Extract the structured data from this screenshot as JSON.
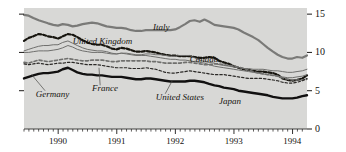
{
  "chart_data": {
    "type": "line",
    "title": "",
    "subtitle": "",
    "xlabel": "",
    "ylabel": "",
    "ylim": [
      0,
      15.8
    ],
    "yticks": [
      0,
      5,
      10,
      15
    ],
    "ytick_labels": [
      "0",
      "5",
      "10",
      "15"
    ],
    "y_axis_position": "right",
    "xlim": [
      1989.42,
      1994.25
    ],
    "xticks": [
      1990,
      1991,
      1992,
      1993,
      1994
    ],
    "xtick_labels": [
      "1990",
      "1991",
      "1992",
      "1993",
      "1994"
    ],
    "minor_xticks": "monthly",
    "grid": false,
    "legend": "inline-annotations",
    "plot_background": "#d8d8d6",
    "series": [
      {
        "name": "Italy",
        "color": "#7a7a78",
        "width": 2.2,
        "dash": "none",
        "label_x": 1991.62,
        "label_y": 13.15,
        "x": [
          1989.42,
          1989.5,
          1989.58,
          1989.67,
          1989.75,
          1989.83,
          1989.92,
          1990.0,
          1990.08,
          1990.17,
          1990.25,
          1990.33,
          1990.42,
          1990.5,
          1990.58,
          1990.67,
          1990.75,
          1990.83,
          1990.92,
          1991.0,
          1991.08,
          1991.17,
          1991.25,
          1991.33,
          1991.42,
          1991.5,
          1991.58,
          1991.67,
          1991.75,
          1991.83,
          1991.92,
          1992.0,
          1992.08,
          1992.17,
          1992.25,
          1992.33,
          1992.42,
          1992.5,
          1992.58,
          1992.67,
          1992.75,
          1992.83,
          1992.92,
          1993.0,
          1993.08,
          1993.17,
          1993.25,
          1993.33,
          1993.42,
          1993.5,
          1993.58,
          1993.67,
          1993.75,
          1993.83,
          1993.92,
          1994.0,
          1994.08,
          1994.17,
          1994.25
        ],
        "y": [
          14.9,
          14.8,
          14.5,
          14.2,
          14.0,
          13.8,
          13.6,
          13.5,
          13.7,
          13.6,
          13.4,
          13.5,
          13.7,
          13.8,
          13.9,
          13.8,
          13.6,
          13.4,
          13.3,
          13.2,
          13.2,
          13.1,
          12.9,
          12.8,
          12.8,
          12.9,
          12.9,
          12.9,
          12.9,
          12.9,
          12.9,
          13.0,
          13.3,
          13.7,
          14.1,
          14.2,
          14.0,
          14.3,
          14.0,
          13.6,
          13.5,
          13.4,
          13.3,
          13.2,
          13.0,
          12.6,
          12.3,
          12.0,
          11.6,
          11.1,
          10.6,
          10.1,
          9.7,
          9.4,
          9.2,
          9.2,
          9.4,
          9.3,
          9.6
        ]
      },
      {
        "name": "United Kingdom",
        "color": "#17150f",
        "width": 2.2,
        "dash": "dashed-thick",
        "label_x": 1990.25,
        "label_y": 11.35,
        "x": [
          1989.42,
          1989.5,
          1989.58,
          1989.67,
          1989.75,
          1989.83,
          1989.92,
          1990.0,
          1990.08,
          1990.17,
          1990.25,
          1990.33,
          1990.42,
          1990.5,
          1990.58,
          1990.67,
          1990.75,
          1990.83,
          1990.92,
          1991.0,
          1991.08,
          1991.17,
          1991.25,
          1991.33,
          1991.42,
          1991.5,
          1991.58,
          1991.67,
          1991.75,
          1991.83,
          1991.92,
          1992.0,
          1992.08,
          1992.17,
          1992.25,
          1992.33,
          1992.42,
          1992.5,
          1992.58,
          1992.67,
          1992.75,
          1992.83,
          1992.92,
          1993.0,
          1993.08,
          1993.17,
          1993.25,
          1993.33,
          1993.42,
          1993.5,
          1993.58,
          1993.67,
          1993.75,
          1993.83,
          1993.92,
          1994.0,
          1994.08,
          1994.17,
          1994.25
        ],
        "y": [
          11.5,
          11.9,
          12.1,
          12.4,
          12.3,
          12.1,
          12.0,
          11.8,
          12.1,
          12.4,
          12.3,
          12.0,
          11.6,
          11.3,
          11.1,
          11.0,
          11.0,
          10.8,
          10.5,
          10.4,
          10.6,
          10.5,
          10.3,
          10.1,
          10.1,
          10.2,
          10.1,
          10.0,
          9.8,
          9.7,
          9.6,
          9.6,
          9.5,
          9.5,
          9.5,
          9.4,
          9.3,
          9.3,
          9.4,
          9.3,
          8.9,
          8.7,
          8.5,
          8.2,
          8.0,
          7.8,
          7.7,
          7.6,
          7.5,
          7.5,
          7.4,
          7.3,
          7.1,
          6.6,
          6.4,
          6.3,
          6.4,
          6.6,
          7.0
        ]
      },
      {
        "name": "Canada",
        "color": "#6f6f6d",
        "width": 1.0,
        "dash": "none",
        "label_x": 1992.25,
        "label_y": 9.05,
        "x": [
          1989.42,
          1989.5,
          1989.58,
          1989.67,
          1989.75,
          1989.83,
          1989.92,
          1990.0,
          1990.08,
          1990.17,
          1990.25,
          1990.33,
          1990.42,
          1990.5,
          1990.58,
          1990.67,
          1990.75,
          1990.83,
          1990.92,
          1991.0,
          1991.08,
          1991.17,
          1991.25,
          1991.33,
          1991.42,
          1991.5,
          1991.58,
          1991.67,
          1991.75,
          1991.83,
          1991.92,
          1992.0,
          1992.08,
          1992.17,
          1992.25,
          1992.33,
          1992.42,
          1992.5,
          1992.58,
          1992.67,
          1992.75,
          1992.83,
          1992.92,
          1993.0,
          1993.08,
          1993.17,
          1993.25,
          1993.33,
          1993.42,
          1993.5,
          1993.58,
          1993.67,
          1993.75,
          1993.83,
          1993.92,
          1994.0,
          1994.08,
          1994.17,
          1994.25
        ],
        "y": [
          10.2,
          10.4,
          10.6,
          10.8,
          10.9,
          10.9,
          11.0,
          11.0,
          11.3,
          11.5,
          11.2,
          10.9,
          10.6,
          10.4,
          10.3,
          10.2,
          10.2,
          10.1,
          9.9,
          9.8,
          9.9,
          9.9,
          9.8,
          9.7,
          9.7,
          9.8,
          9.8,
          9.7,
          9.7,
          9.6,
          9.5,
          9.5,
          9.6,
          9.6,
          9.6,
          9.3,
          9.0,
          8.8,
          8.7,
          8.6,
          8.4,
          8.3,
          8.2,
          8.1,
          8.0,
          7.9,
          7.9,
          7.8,
          7.8,
          7.8,
          7.7,
          7.6,
          7.6,
          7.5,
          7.4,
          7.4,
          7.5,
          7.6,
          7.8
        ]
      },
      {
        "name": "France",
        "color": "#6f6f6d",
        "width": 1.6,
        "dash": "dashed-medium",
        "label_x": 1990.58,
        "label_y": 5.2,
        "x": [
          1989.42,
          1989.5,
          1989.58,
          1989.67,
          1989.75,
          1989.83,
          1989.92,
          1990.0,
          1990.08,
          1990.17,
          1990.25,
          1990.33,
          1990.42,
          1990.5,
          1990.58,
          1990.67,
          1990.75,
          1990.83,
          1990.92,
          1991.0,
          1991.08,
          1991.17,
          1991.25,
          1991.33,
          1991.42,
          1991.5,
          1991.58,
          1991.67,
          1991.75,
          1991.83,
          1991.92,
          1992.0,
          1992.08,
          1992.17,
          1992.25,
          1992.33,
          1992.42,
          1992.5,
          1992.58,
          1992.67,
          1992.75,
          1992.83,
          1992.92,
          1993.0,
          1993.08,
          1993.17,
          1993.25,
          1993.33,
          1993.42,
          1993.5,
          1993.58,
          1993.67,
          1993.75,
          1993.83,
          1993.92,
          1994.0,
          1994.08,
          1994.17,
          1994.25
        ],
        "y": [
          8.7,
          8.6,
          8.8,
          9.0,
          8.9,
          8.8,
          8.9,
          9.0,
          9.1,
          9.2,
          9.1,
          9.0,
          8.9,
          8.9,
          9.0,
          9.0,
          9.0,
          8.9,
          8.8,
          8.8,
          8.9,
          8.9,
          8.9,
          8.9,
          8.9,
          8.9,
          8.8,
          8.8,
          8.7,
          8.6,
          8.6,
          8.6,
          8.6,
          8.7,
          8.7,
          8.6,
          8.5,
          8.4,
          8.4,
          8.5,
          8.5,
          8.4,
          8.3,
          8.2,
          8.1,
          7.9,
          7.7,
          7.5,
          7.3,
          7.2,
          7.1,
          7.0,
          6.9,
          6.7,
          6.5,
          6.4,
          6.4,
          6.4,
          6.5
        ]
      },
      {
        "name": "United States",
        "color": "#2a2826",
        "width": 1.2,
        "dash": "dashed-fine",
        "label_x": 1991.67,
        "label_y": 4.0,
        "x": [
          1989.42,
          1989.5,
          1989.58,
          1989.67,
          1989.75,
          1989.83,
          1989.92,
          1990.0,
          1990.08,
          1990.17,
          1990.25,
          1990.33,
          1990.42,
          1990.5,
          1990.58,
          1990.67,
          1990.75,
          1990.83,
          1990.92,
          1991.0,
          1991.08,
          1991.17,
          1991.25,
          1991.33,
          1991.42,
          1991.5,
          1991.58,
          1991.67,
          1991.75,
          1991.83,
          1991.92,
          1992.0,
          1992.08,
          1992.17,
          1992.25,
          1992.33,
          1992.42,
          1992.5,
          1992.58,
          1992.67,
          1992.75,
          1992.83,
          1992.92,
          1993.0,
          1993.08,
          1993.17,
          1993.25,
          1993.33,
          1993.42,
          1993.5,
          1993.58,
          1993.67,
          1993.75,
          1993.83,
          1993.92,
          1994.0,
          1994.08,
          1994.17,
          1994.25
        ],
        "y": [
          8.5,
          8.4,
          8.5,
          8.6,
          8.5,
          8.4,
          8.5,
          8.6,
          8.6,
          8.7,
          8.7,
          8.6,
          8.5,
          8.4,
          8.4,
          8.4,
          8.3,
          8.2,
          8.1,
          8.0,
          8.0,
          8.0,
          7.9,
          7.9,
          7.9,
          8.0,
          7.9,
          7.8,
          7.6,
          7.4,
          7.3,
          7.3,
          7.4,
          7.5,
          7.6,
          7.5,
          7.4,
          7.3,
          7.2,
          7.1,
          7.1,
          7.1,
          7.0,
          6.9,
          6.8,
          6.7,
          6.6,
          6.6,
          6.6,
          6.6,
          6.5,
          6.4,
          6.3,
          6.1,
          6.0,
          6.0,
          6.1,
          6.3,
          6.6
        ]
      },
      {
        "name": "Germany",
        "color": "#6f6f6d",
        "width": 1.0,
        "dash": "none",
        "label_x": 1989.62,
        "label_y": 4.5,
        "x": [
          1989.42,
          1989.5,
          1989.58,
          1989.67,
          1989.75,
          1989.83,
          1989.92,
          1990.0,
          1990.08,
          1990.17,
          1990.25,
          1990.33,
          1990.42,
          1990.5,
          1990.58,
          1990.67,
          1990.75,
          1990.83,
          1990.92,
          1991.0,
          1991.08,
          1991.17,
          1991.25,
          1991.33,
          1991.42,
          1991.5,
          1991.58,
          1991.67,
          1991.75,
          1991.83,
          1991.92,
          1992.0,
          1992.08,
          1992.17,
          1992.25,
          1992.33,
          1992.42,
          1992.5,
          1992.58,
          1992.67,
          1992.75,
          1992.83,
          1992.92,
          1993.0,
          1993.08,
          1993.17,
          1993.25,
          1993.33,
          1993.42,
          1993.5,
          1993.58,
          1993.67,
          1993.75,
          1993.83,
          1993.92,
          1994.0,
          1994.08,
          1994.17,
          1994.25
        ],
        "y": [
          10.0,
          10.0,
          10.1,
          10.2,
          10.2,
          10.2,
          10.3,
          10.4,
          10.6,
          10.9,
          10.7,
          10.4,
          10.2,
          10.1,
          10.0,
          10.0,
          10.0,
          9.9,
          9.8,
          9.8,
          9.9,
          9.8,
          9.7,
          9.6,
          9.6,
          9.6,
          9.5,
          9.4,
          9.3,
          9.2,
          9.1,
          9.1,
          9.0,
          9.0,
          8.9,
          8.8,
          8.7,
          8.6,
          8.4,
          8.2,
          8.1,
          8.0,
          7.9,
          7.8,
          7.7,
          7.6,
          7.5,
          7.4,
          7.3,
          7.2,
          7.1,
          7.0,
          6.9,
          6.8,
          6.7,
          6.7,
          6.8,
          6.9,
          7.1
        ]
      },
      {
        "name": "Japan",
        "color": "#111010",
        "width": 2.4,
        "dash": "none",
        "label_x": 1992.75,
        "label_y": 3.5,
        "x": [
          1989.42,
          1989.5,
          1989.58,
          1989.67,
          1989.75,
          1989.83,
          1989.92,
          1990.0,
          1990.08,
          1990.17,
          1990.25,
          1990.33,
          1990.42,
          1990.5,
          1990.58,
          1990.67,
          1990.75,
          1990.83,
          1990.92,
          1991.0,
          1991.08,
          1991.17,
          1991.25,
          1991.33,
          1991.42,
          1991.5,
          1991.58,
          1991.67,
          1991.75,
          1991.83,
          1991.92,
          1992.0,
          1992.08,
          1992.17,
          1992.25,
          1992.33,
          1992.42,
          1992.5,
          1992.58,
          1992.67,
          1992.75,
          1992.83,
          1992.92,
          1993.0,
          1993.08,
          1993.17,
          1993.25,
          1993.33,
          1993.42,
          1993.5,
          1993.58,
          1993.67,
          1993.75,
          1993.83,
          1993.92,
          1994.0,
          1994.08,
          1994.17,
          1994.25
        ],
        "y": [
          6.6,
          6.8,
          7.0,
          7.2,
          7.3,
          7.3,
          7.4,
          7.5,
          7.8,
          8.0,
          7.7,
          7.4,
          7.2,
          7.1,
          7.1,
          7.0,
          7.0,
          6.9,
          6.8,
          6.8,
          6.8,
          6.7,
          6.6,
          6.5,
          6.5,
          6.6,
          6.6,
          6.5,
          6.4,
          6.3,
          6.2,
          6.2,
          6.2,
          6.2,
          6.3,
          6.3,
          6.2,
          6.1,
          5.9,
          5.7,
          5.6,
          5.4,
          5.3,
          5.2,
          5.0,
          4.9,
          4.8,
          4.7,
          4.6,
          4.5,
          4.4,
          4.2,
          4.1,
          4.0,
          4.0,
          4.0,
          4.1,
          4.3,
          4.4
        ]
      }
    ]
  },
  "labels": {
    "italy": "Italy",
    "united_kingdom": "United Kingdom",
    "canada": "Canada",
    "france": "France",
    "united_states": "United States",
    "germany": "Germany",
    "japan": "Japan"
  },
  "axis": {
    "y_tick_0": "0",
    "y_tick_5": "5",
    "y_tick_10": "10",
    "y_tick_15": "15",
    "x_tick_1990": "1990",
    "x_tick_1991": "1991",
    "x_tick_1992": "1992",
    "x_tick_1993": "1993",
    "x_tick_1994": "1994"
  }
}
